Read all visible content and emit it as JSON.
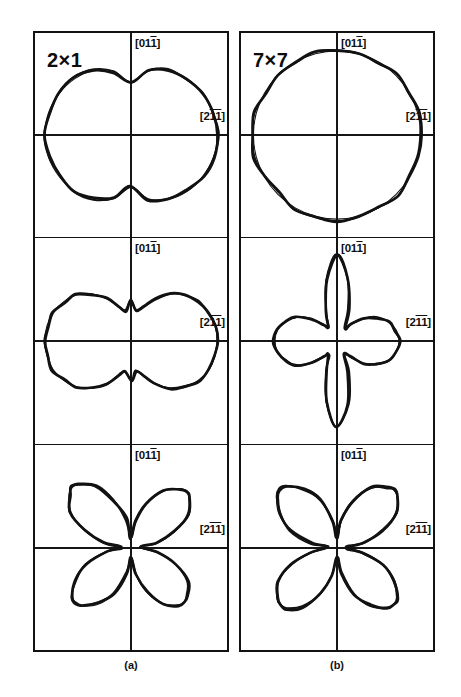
{
  "figure": {
    "caption_a": "(a)",
    "caption_b": "(b)",
    "columns": [
      {
        "id": "a",
        "reconstruction": "2×1",
        "caption": "(a)"
      },
      {
        "id": "b",
        "reconstruction": "7×7",
        "caption": "(b)"
      }
    ],
    "axis_labels": {
      "vertical": "[011]",
      "vertical_parts": {
        "pre": "[01",
        "overbar": "1",
        "post": "]"
      },
      "horizontal": "[211]",
      "horizontal_parts": {
        "pre": "[2",
        "overbar": "11",
        "post": "]"
      }
    },
    "colors": {
      "line": "#121212",
      "background": "#ffffff",
      "axis": "#161616"
    }
  },
  "chart_data": {
    "type": "line",
    "subtitle": "",
    "plot_kind": "polar",
    "grid": true,
    "legend": "none",
    "angle_unit": "degrees",
    "radial_label": "",
    "angular_reference": "0° along [211] (horizontal, right); 90° along [011] (vertical, up)",
    "panels": [
      {
        "row": 0,
        "column": "a",
        "reconstruction": "2×1",
        "shape": "peanut / dumbbell, two-fold symmetric about horizontal axis, indented at top and bottom centre",
        "symmetry_fold": 2,
        "theta": [
          0,
          15,
          30,
          45,
          60,
          75,
          90,
          105,
          120,
          135,
          150,
          165,
          180,
          195,
          210,
          225,
          240,
          255,
          270,
          285,
          300,
          315,
          330,
          345
        ],
        "r_smooth": [
          1.0,
          0.99,
          0.96,
          0.92,
          0.86,
          0.76,
          0.6,
          0.76,
          0.86,
          0.92,
          0.96,
          0.99,
          1.0,
          0.99,
          0.96,
          0.92,
          0.86,
          0.76,
          0.6,
          0.76,
          0.86,
          0.92,
          0.96,
          0.99
        ],
        "r_measured": [
          1.01,
          0.99,
          0.97,
          0.91,
          0.87,
          0.77,
          0.61,
          0.75,
          0.87,
          0.93,
          0.97,
          0.98,
          1.0,
          0.98,
          0.95,
          0.93,
          0.85,
          0.75,
          0.59,
          0.77,
          0.85,
          0.91,
          0.97,
          1.0
        ],
        "r_max": 1.0,
        "r_min": 0.6
      },
      {
        "row": 0,
        "column": "b",
        "reconstruction": "7×7",
        "shape": "near-isotropic circle, slight flattening lower-left",
        "symmetry_fold": 1,
        "theta": [
          0,
          15,
          30,
          45,
          60,
          75,
          90,
          105,
          120,
          135,
          150,
          165,
          180,
          195,
          210,
          225,
          240,
          255,
          270,
          285,
          300,
          315,
          330,
          345
        ],
        "r_smooth": [
          0.97,
          0.97,
          0.97,
          0.97,
          0.97,
          0.97,
          0.97,
          0.97,
          0.97,
          0.97,
          0.97,
          0.97,
          0.97,
          0.97,
          0.97,
          0.97,
          0.97,
          0.97,
          0.97,
          0.97,
          0.97,
          0.97,
          0.97,
          0.97
        ],
        "r_measured": [
          0.98,
          0.99,
          0.97,
          0.99,
          0.96,
          0.98,
          0.97,
          0.99,
          0.96,
          0.98,
          0.95,
          0.99,
          0.98,
          1.0,
          0.97,
          0.95,
          0.99,
          0.97,
          1.0,
          0.98,
          0.96,
          0.99,
          0.97,
          0.98
        ],
        "r_max": 1.0,
        "r_min": 0.95
      },
      {
        "row": 1,
        "column": "a",
        "reconstruction": "2×1",
        "shape": "horizontally elongated lobe with small vertical lobes (cross-like, strongly anisotropic)",
        "symmetry_fold": 2,
        "theta": [
          0,
          10,
          20,
          30,
          40,
          50,
          60,
          70,
          80,
          90,
          100,
          110,
          120,
          130,
          140,
          150,
          160,
          170,
          180,
          190,
          200,
          210,
          220,
          230,
          240,
          250,
          260,
          270,
          280,
          290,
          300,
          310,
          320,
          330,
          340,
          350
        ],
        "r_smooth": [
          1.0,
          0.99,
          0.96,
          0.9,
          0.82,
          0.7,
          0.56,
          0.42,
          0.36,
          0.45,
          0.36,
          0.42,
          0.56,
          0.7,
          0.82,
          0.9,
          0.96,
          0.99,
          1.0,
          0.99,
          0.96,
          0.9,
          0.82,
          0.7,
          0.56,
          0.42,
          0.36,
          0.45,
          0.36,
          0.42,
          0.56,
          0.7,
          0.82,
          0.9,
          0.96,
          0.99
        ],
        "r_measured": [
          1.0,
          0.99,
          0.95,
          0.91,
          0.81,
          0.71,
          0.55,
          0.43,
          0.35,
          0.46,
          0.35,
          0.41,
          0.57,
          0.69,
          0.83,
          0.89,
          0.97,
          0.98,
          1.0,
          0.98,
          0.97,
          0.89,
          0.83,
          0.69,
          0.57,
          0.41,
          0.35,
          0.46,
          0.35,
          0.43,
          0.55,
          0.71,
          0.81,
          0.91,
          0.95,
          0.99
        ],
        "r_max": 1.0,
        "r_min": 0.35
      },
      {
        "row": 1,
        "column": "b",
        "reconstruction": "7×7",
        "shape": "four-lobed clover aligned with the [011] and [211] axes, vertical lobes longer",
        "symmetry_fold": 4,
        "theta": [
          0,
          10,
          20,
          30,
          40,
          50,
          60,
          70,
          80,
          90,
          100,
          110,
          120,
          130,
          140,
          150,
          160,
          170,
          180,
          190,
          200,
          210,
          220,
          230,
          240,
          250,
          260,
          270,
          280,
          290,
          300,
          310,
          320,
          330,
          340,
          350
        ],
        "r_smooth": [
          0.72,
          0.7,
          0.64,
          0.54,
          0.4,
          0.25,
          0.18,
          0.38,
          0.72,
          0.98,
          0.72,
          0.38,
          0.18,
          0.25,
          0.4,
          0.54,
          0.64,
          0.7,
          0.72,
          0.7,
          0.64,
          0.54,
          0.4,
          0.25,
          0.18,
          0.38,
          0.72,
          0.98,
          0.72,
          0.38,
          0.18,
          0.25,
          0.4,
          0.54,
          0.64,
          0.7
        ],
        "r_measured": [
          0.73,
          0.69,
          0.65,
          0.53,
          0.41,
          0.24,
          0.17,
          0.39,
          0.73,
          0.99,
          0.71,
          0.37,
          0.19,
          0.24,
          0.39,
          0.55,
          0.63,
          0.71,
          0.73,
          0.71,
          0.63,
          0.55,
          0.39,
          0.24,
          0.19,
          0.37,
          0.71,
          0.99,
          0.73,
          0.39,
          0.17,
          0.24,
          0.41,
          0.53,
          0.65,
          0.69
        ],
        "r_max": 0.98,
        "r_min": 0.17
      },
      {
        "row": 2,
        "column": "a",
        "reconstruction": "2×1",
        "shape": "four-lobed clover rotated 45°, slightly asymmetric (upper-left lobe longest)",
        "symmetry_fold": 4,
        "rotation_deg": 45,
        "theta": [
          0,
          10,
          20,
          30,
          40,
          45,
          50,
          60,
          70,
          80,
          90,
          100,
          110,
          120,
          130,
          135,
          140,
          150,
          160,
          170,
          180,
          190,
          200,
          210,
          220,
          225,
          230,
          240,
          250,
          260,
          270,
          280,
          290,
          300,
          310,
          315,
          320,
          330,
          340,
          350
        ],
        "r_smooth": [
          0.1,
          0.3,
          0.55,
          0.75,
          0.88,
          0.9,
          0.88,
          0.75,
          0.55,
          0.3,
          0.1,
          0.32,
          0.58,
          0.8,
          0.94,
          0.97,
          0.94,
          0.8,
          0.58,
          0.32,
          0.1,
          0.3,
          0.55,
          0.75,
          0.88,
          0.9,
          0.88,
          0.75,
          0.55,
          0.3,
          0.1,
          0.3,
          0.55,
          0.75,
          0.86,
          0.88,
          0.86,
          0.75,
          0.55,
          0.3
        ],
        "r_measured": [
          0.11,
          0.31,
          0.54,
          0.76,
          0.89,
          0.91,
          0.87,
          0.76,
          0.54,
          0.31,
          0.11,
          0.33,
          0.57,
          0.81,
          0.95,
          0.98,
          0.93,
          0.81,
          0.57,
          0.33,
          0.11,
          0.29,
          0.56,
          0.74,
          0.89,
          0.91,
          0.87,
          0.74,
          0.56,
          0.29,
          0.11,
          0.31,
          0.54,
          0.76,
          0.87,
          0.89,
          0.85,
          0.76,
          0.54,
          0.31
        ],
        "r_max": 0.97,
        "r_min": 0.1
      },
      {
        "row": 2,
        "column": "b",
        "reconstruction": "7×7",
        "shape": "four-lobed clover rotated 45°, nearly symmetric",
        "symmetry_fold": 4,
        "rotation_deg": 45,
        "theta": [
          0,
          10,
          20,
          30,
          40,
          45,
          50,
          60,
          70,
          80,
          90,
          100,
          110,
          120,
          130,
          135,
          140,
          150,
          160,
          170,
          180,
          190,
          200,
          210,
          220,
          225,
          230,
          240,
          250,
          260,
          270,
          280,
          290,
          300,
          310,
          315,
          320,
          330,
          340,
          350
        ],
        "r_smooth": [
          0.1,
          0.31,
          0.57,
          0.78,
          0.91,
          0.93,
          0.91,
          0.78,
          0.57,
          0.31,
          0.1,
          0.31,
          0.57,
          0.78,
          0.91,
          0.93,
          0.91,
          0.78,
          0.57,
          0.31,
          0.1,
          0.31,
          0.57,
          0.78,
          0.91,
          0.93,
          0.91,
          0.78,
          0.57,
          0.31,
          0.1,
          0.31,
          0.57,
          0.78,
          0.91,
          0.93,
          0.91,
          0.78,
          0.57,
          0.31
        ],
        "r_measured": [
          0.11,
          0.32,
          0.56,
          0.79,
          0.92,
          0.94,
          0.9,
          0.79,
          0.56,
          0.32,
          0.11,
          0.3,
          0.58,
          0.77,
          0.92,
          0.94,
          0.9,
          0.77,
          0.58,
          0.3,
          0.11,
          0.32,
          0.56,
          0.79,
          0.9,
          0.93,
          0.92,
          0.79,
          0.56,
          0.32,
          0.11,
          0.3,
          0.58,
          0.77,
          0.9,
          0.92,
          0.92,
          0.77,
          0.58,
          0.3
        ],
        "r_max": 0.93,
        "r_min": 0.1
      }
    ]
  }
}
